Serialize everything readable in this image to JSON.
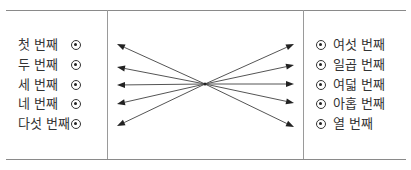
{
  "diagram": {
    "left_items": [
      {
        "label": "첫 번째",
        "y": 45
      },
      {
        "label": "두 번째",
        "y": 65
      },
      {
        "label": "세 번째",
        "y": 85
      },
      {
        "label": "네 번째",
        "y": 104
      },
      {
        "label": "다섯 번째",
        "y": 124
      }
    ],
    "right_items": [
      {
        "label": "여섯 번째",
        "y": 45
      },
      {
        "label": "일곱 번째",
        "y": 65
      },
      {
        "label": "여덟 번째",
        "y": 85
      },
      {
        "label": "아홉 번째",
        "y": 104
      },
      {
        "label": "열 번째",
        "y": 124
      }
    ],
    "center": {
      "x": 205,
      "y": 84
    },
    "left_arrow_tips": [
      [
        117,
        44
      ],
      [
        117,
        67
      ],
      [
        117,
        85
      ],
      [
        117,
        104
      ],
      [
        117,
        126
      ]
    ],
    "right_arrow_tips": [
      [
        294,
        44
      ],
      [
        294,
        65
      ],
      [
        294,
        84
      ],
      [
        294,
        103
      ],
      [
        294,
        127
      ]
    ],
    "colors": {
      "line": "#8a8a8a",
      "arrow": "#555555",
      "text": "#333333"
    }
  }
}
